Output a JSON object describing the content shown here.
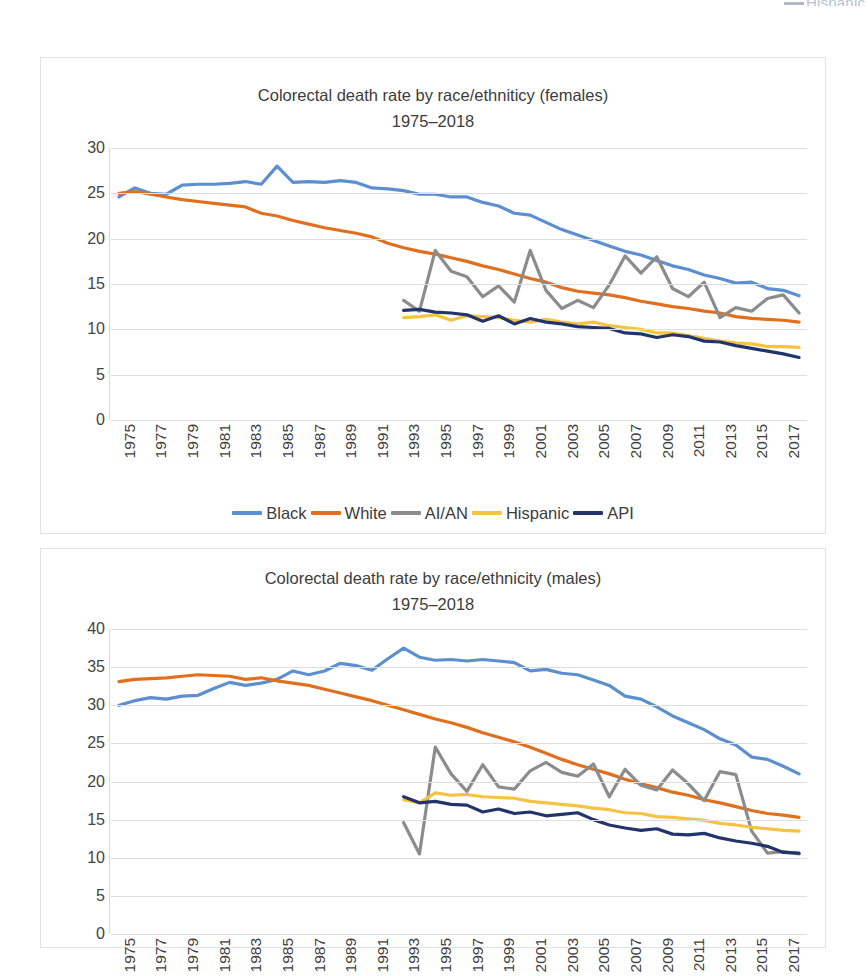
{
  "page": {
    "top_fragment": "Hispanic"
  },
  "series_colors": {
    "Black": "#5B8FD0",
    "White": "#E0701E",
    "AI/AN": "#8C8C8C",
    "Hispanic": "#F6C242",
    "API": "#23346B"
  },
  "legend": {
    "items": [
      {
        "label": "Black",
        "color": "#5B8FD0"
      },
      {
        "label": "White",
        "color": "#E0701E"
      },
      {
        "label": "AI/AN",
        "color": "#8C8C8C"
      },
      {
        "label": "Hispanic",
        "color": "#F6C242"
      },
      {
        "label": "API",
        "color": "#23346B"
      }
    ]
  },
  "charts": [
    {
      "id": "females",
      "title_line1": "Colorectal death rate by race/ethniticy (females)",
      "title_line2": "1975–2018"
    },
    {
      "id": "males",
      "title_line1": "Colorectal death rate by race/ethnicity (males)",
      "title_line2": "1975–2018"
    }
  ],
  "chart_data": [
    {
      "type": "line",
      "id": "females",
      "title": "Colorectal death rate by race/ethniticy (females) 1975–2018",
      "xlabel": "",
      "ylabel": "",
      "ylim": [
        0,
        30
      ],
      "yticks": [
        0,
        5,
        10,
        15,
        20,
        25,
        30
      ],
      "grid": true,
      "legend_position": "bottom",
      "xlim": [
        1975,
        2018
      ],
      "xticks": [
        1975,
        1977,
        1979,
        1981,
        1983,
        1985,
        1987,
        1989,
        1991,
        1993,
        1995,
        1997,
        1999,
        2001,
        2003,
        2005,
        2007,
        2009,
        2011,
        2013,
        2015,
        2017
      ],
      "x": [
        1975,
        1976,
        1977,
        1978,
        1979,
        1980,
        1981,
        1982,
        1983,
        1984,
        1985,
        1986,
        1987,
        1988,
        1989,
        1990,
        1991,
        1992,
        1993,
        1994,
        1995,
        1996,
        1997,
        1998,
        1999,
        2000,
        2001,
        2002,
        2003,
        2004,
        2005,
        2006,
        2007,
        2008,
        2009,
        2010,
        2011,
        2012,
        2013,
        2014,
        2015,
        2016,
        2017,
        2018
      ],
      "series": [
        {
          "name": "Black",
          "color": "#5B8FD0",
          "values": [
            24.6,
            25.6,
            25.0,
            24.9,
            25.9,
            26.0,
            26.0,
            26.1,
            26.3,
            26.0,
            28.0,
            26.2,
            26.3,
            26.2,
            26.4,
            26.2,
            25.6,
            25.5,
            25.3,
            24.9,
            24.9,
            24.6,
            24.6,
            24.0,
            23.6,
            22.8,
            22.6,
            21.8,
            21.0,
            20.4,
            19.8,
            19.2,
            18.6,
            18.2,
            17.6,
            17.0,
            16.6,
            16.0,
            15.6,
            15.1,
            15.2,
            14.5,
            14.3,
            13.7
          ]
        },
        {
          "name": "White",
          "color": "#E0701E",
          "values": [
            25.0,
            25.2,
            24.9,
            24.6,
            24.3,
            24.1,
            23.9,
            23.7,
            23.5,
            22.8,
            22.5,
            22.0,
            21.6,
            21.2,
            20.9,
            20.6,
            20.2,
            19.5,
            19.0,
            18.6,
            18.3,
            17.9,
            17.5,
            17.0,
            16.6,
            16.1,
            15.6,
            15.2,
            14.6,
            14.2,
            14.0,
            13.8,
            13.5,
            13.1,
            12.8,
            12.5,
            12.3,
            12.0,
            11.8,
            11.4,
            11.2,
            11.1,
            11.0,
            10.8
          ]
        },
        {
          "name": "AI/AN",
          "color": "#8C8C8C",
          "values": [
            null,
            null,
            null,
            null,
            null,
            null,
            null,
            null,
            null,
            null,
            null,
            null,
            null,
            null,
            null,
            null,
            null,
            null,
            13.2,
            12.0,
            18.7,
            16.4,
            15.8,
            13.6,
            14.8,
            13.0,
            18.7,
            14.3,
            12.3,
            13.2,
            12.4,
            14.9,
            18.1,
            16.2,
            18.0,
            14.5,
            13.6,
            15.2,
            11.3,
            12.4,
            12.0,
            13.4,
            13.8,
            11.8
          ]
        },
        {
          "name": "Hispanic",
          "color": "#F6C242",
          "values": [
            null,
            null,
            null,
            null,
            null,
            null,
            null,
            null,
            null,
            null,
            null,
            null,
            null,
            null,
            null,
            null,
            null,
            null,
            11.3,
            11.4,
            11.6,
            11.0,
            11.5,
            11.4,
            11.3,
            11.0,
            10.8,
            11.1,
            10.8,
            10.6,
            10.8,
            10.4,
            10.2,
            10.0,
            9.6,
            9.6,
            9.3,
            9.0,
            8.7,
            8.5,
            8.4,
            8.1,
            8.1,
            8.0
          ]
        },
        {
          "name": "API",
          "color": "#23346B",
          "values": [
            null,
            null,
            null,
            null,
            null,
            null,
            null,
            null,
            null,
            null,
            null,
            null,
            null,
            null,
            null,
            null,
            null,
            null,
            12.1,
            12.2,
            11.9,
            11.8,
            11.6,
            10.9,
            11.5,
            10.6,
            11.2,
            10.8,
            10.6,
            10.3,
            10.2,
            10.1,
            9.6,
            9.5,
            9.1,
            9.4,
            9.2,
            8.7,
            8.6,
            8.2,
            7.9,
            7.6,
            7.3,
            6.9
          ]
        }
      ]
    },
    {
      "type": "line",
      "id": "males",
      "title": "Colorectal death rate by race/ethnicity (males) 1975–2018",
      "xlabel": "",
      "ylabel": "",
      "ylim": [
        0,
        40
      ],
      "yticks": [
        0,
        5,
        10,
        15,
        20,
        25,
        30,
        35,
        40
      ],
      "grid": true,
      "legend_position": "bottom",
      "xlim": [
        1975,
        2018
      ],
      "xticks": [
        1975,
        1977,
        1979,
        1981,
        1983,
        1985,
        1987,
        1989,
        1991,
        1993,
        1995,
        1997,
        1999,
        2001,
        2003,
        2005,
        2007,
        2009,
        2011,
        2013,
        2015,
        2017
      ],
      "x": [
        1975,
        1976,
        1977,
        1978,
        1979,
        1980,
        1981,
        1982,
        1983,
        1984,
        1985,
        1986,
        1987,
        1988,
        1989,
        1990,
        1991,
        1992,
        1993,
        1994,
        1995,
        1996,
        1997,
        1998,
        1999,
        2000,
        2001,
        2002,
        2003,
        2004,
        2005,
        2006,
        2007,
        2008,
        2009,
        2010,
        2011,
        2012,
        2013,
        2014,
        2015,
        2016,
        2017,
        2018
      ],
      "series": [
        {
          "name": "Black",
          "color": "#5B8FD0",
          "values": [
            30.0,
            30.6,
            31.0,
            30.8,
            31.2,
            31.3,
            32.2,
            33.0,
            32.6,
            32.9,
            33.4,
            34.5,
            34.0,
            34.5,
            35.5,
            35.2,
            34.6,
            36.1,
            37.5,
            36.3,
            35.9,
            36.0,
            35.8,
            36.0,
            35.8,
            35.6,
            34.5,
            34.7,
            34.2,
            34.0,
            33.3,
            32.6,
            31.2,
            30.8,
            29.8,
            28.6,
            27.7,
            26.8,
            25.6,
            24.8,
            23.2,
            22.9,
            22.0,
            21.0
          ]
        },
        {
          "name": "White",
          "color": "#E0701E",
          "values": [
            33.1,
            33.4,
            33.5,
            33.6,
            33.8,
            34.0,
            33.9,
            33.8,
            33.4,
            33.6,
            33.2,
            32.9,
            32.6,
            32.1,
            31.6,
            31.1,
            30.6,
            30.0,
            29.4,
            28.8,
            28.2,
            27.7,
            27.1,
            26.4,
            25.8,
            25.2,
            24.5,
            23.7,
            22.9,
            22.2,
            21.6,
            21.0,
            20.3,
            19.7,
            19.2,
            18.6,
            18.2,
            17.6,
            17.2,
            16.7,
            16.2,
            15.8,
            15.6,
            15.3
          ]
        },
        {
          "name": "AI/AN",
          "color": "#8C8C8C",
          "values": [
            null,
            null,
            null,
            null,
            null,
            null,
            null,
            null,
            null,
            null,
            null,
            null,
            null,
            null,
            null,
            null,
            null,
            null,
            14.6,
            10.5,
            24.5,
            21.0,
            18.7,
            22.2,
            19.3,
            19.0,
            21.4,
            22.5,
            21.2,
            20.7,
            22.3,
            18.0,
            21.6,
            19.5,
            18.9,
            21.5,
            19.7,
            17.5,
            21.3,
            20.9,
            13.5,
            10.6,
            10.8,
            10.5
          ]
        },
        {
          "name": "Hispanic",
          "color": "#F6C242",
          "values": [
            null,
            null,
            null,
            null,
            null,
            null,
            null,
            null,
            null,
            null,
            null,
            null,
            null,
            null,
            null,
            null,
            null,
            null,
            17.6,
            17.2,
            18.5,
            18.2,
            18.3,
            18.0,
            17.9,
            17.8,
            17.4,
            17.2,
            17.0,
            16.8,
            16.5,
            16.3,
            15.9,
            15.8,
            15.4,
            15.3,
            15.1,
            14.9,
            14.5,
            14.3,
            14.0,
            13.8,
            13.6,
            13.5
          ]
        },
        {
          "name": "API",
          "color": "#23346B",
          "values": [
            null,
            null,
            null,
            null,
            null,
            null,
            null,
            null,
            null,
            null,
            null,
            null,
            null,
            null,
            null,
            null,
            null,
            null,
            18.0,
            17.2,
            17.4,
            17.0,
            16.9,
            16.0,
            16.4,
            15.8,
            16.0,
            15.5,
            15.7,
            15.9,
            15.0,
            14.3,
            13.9,
            13.6,
            13.8,
            13.1,
            13.0,
            13.2,
            12.6,
            12.2,
            11.9,
            11.5,
            10.7,
            10.6
          ]
        }
      ]
    }
  ]
}
